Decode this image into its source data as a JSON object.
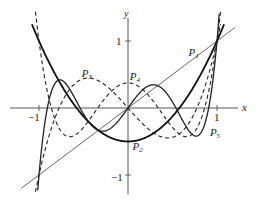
{
  "chart_data": {
    "type": "line",
    "title": "",
    "xlabel": "x",
    "ylabel": "y",
    "xlim": [
      -1.05,
      1.15
    ],
    "ylim": [
      -1.25,
      1.4
    ],
    "x_ticks": [
      {
        "value": -1,
        "label": "−1"
      },
      {
        "value": 1,
        "label": "1"
      }
    ],
    "y_ticks": [
      {
        "value": 1,
        "label": "1"
      },
      {
        "value": -1,
        "label": "−1"
      }
    ],
    "grid": false,
    "legend": "inline labels",
    "series": [
      {
        "name": "P1",
        "label": "P",
        "sub": "1",
        "formula": "x",
        "style": "solid-thin",
        "domain": [
          -1.2,
          1.2
        ],
        "label_x": 0.68,
        "label_y": 0.78
      },
      {
        "name": "P2",
        "label": "P",
        "sub": "2",
        "formula": "(3x^2-1)/2",
        "style": "solid-thick",
        "domain": [
          -1.08,
          1.08
        ],
        "label_x": 0.05,
        "label_y": -0.62
      },
      {
        "name": "P3",
        "label": "P",
        "sub": "3",
        "formula": "(5x^3-3x)/2",
        "style": "dashed",
        "domain": [
          -1.04,
          1.04
        ],
        "label_x": -0.52,
        "label_y": 0.47
      },
      {
        "name": "P4",
        "label": "P",
        "sub": "4",
        "formula": "(35x^4-30x^2+3)/8",
        "style": "dashed",
        "domain": [
          -1.04,
          1.04
        ],
        "label_x": 0.02,
        "label_y": 0.42
      },
      {
        "name": "P5",
        "label": "P",
        "sub": "5",
        "formula": "(63x^5-70x^3+15x)/8",
        "style": "solid-medium",
        "domain": [
          -1.03,
          1.03
        ],
        "label_x": 0.92,
        "label_y": -0.42
      }
    ]
  },
  "layout": {
    "origin_px": [
      128,
      108
    ],
    "unit_x_px": 89,
    "unit_y_px": 67,
    "x_axis_px": [
      10,
      238
    ],
    "y_axis_px": [
      18,
      194
    ]
  },
  "labels": {
    "x_axis": "x",
    "y_axis": "y",
    "y_tick_pos": "1",
    "y_tick_neg": "−1",
    "x_tick_neg": "−1",
    "x_tick_pos": "1"
  }
}
